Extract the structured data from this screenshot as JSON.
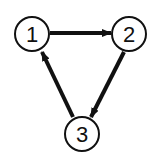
{
  "diagram": {
    "type": "directed-graph",
    "colors": {
      "stroke": "#111111",
      "background": "#ffffff"
    },
    "nodes": [
      {
        "id": "1",
        "label": "1",
        "cx": 32,
        "cy": 34,
        "r": 17
      },
      {
        "id": "2",
        "label": "2",
        "cx": 129,
        "cy": 34,
        "r": 17
      },
      {
        "id": "3",
        "label": "3",
        "cx": 82,
        "cy": 134,
        "r": 17
      }
    ],
    "edges": [
      {
        "from": "1",
        "to": "2"
      },
      {
        "from": "2",
        "to": "3"
      },
      {
        "from": "3",
        "to": "1"
      }
    ]
  }
}
